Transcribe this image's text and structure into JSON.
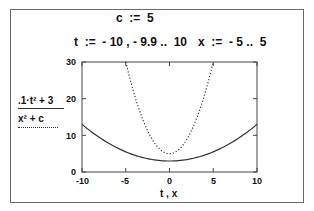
{
  "definitions": {
    "c_def": "c  :=  5",
    "t_def": "t  :=  - 10 , - 9.9 ..  10",
    "x_def": "x  :=  - 5 ..  5"
  },
  "legend": {
    "numerator": ".1·t² + 3",
    "denominator": "x² + c"
  },
  "chart_data": {
    "type": "line",
    "xlabel": "t , x",
    "ylabel": "",
    "xlim": [
      -10,
      10
    ],
    "ylim": [
      0,
      30
    ],
    "x_ticks": [
      "-10",
      "-5",
      "0",
      "5",
      "10"
    ],
    "y_ticks": [
      "0",
      "10",
      "20",
      "30"
    ],
    "grid": false,
    "series": [
      {
        "name": ".1·t² + 3",
        "style": "solid",
        "x": [
          -10,
          -8,
          -6,
          -4,
          -2,
          0,
          2,
          4,
          6,
          8,
          10
        ],
        "values": [
          13,
          9.4,
          6.6,
          4.6,
          3.4,
          3,
          3.4,
          4.6,
          6.6,
          9.4,
          13
        ]
      },
      {
        "name": "x² + c",
        "style": "dotted",
        "x": [
          -5,
          -4,
          -3,
          -2,
          -1,
          0,
          1,
          2,
          3,
          4,
          5
        ],
        "values": [
          30,
          21,
          14,
          9,
          6,
          5,
          6,
          9,
          14,
          21,
          30
        ]
      }
    ]
  }
}
